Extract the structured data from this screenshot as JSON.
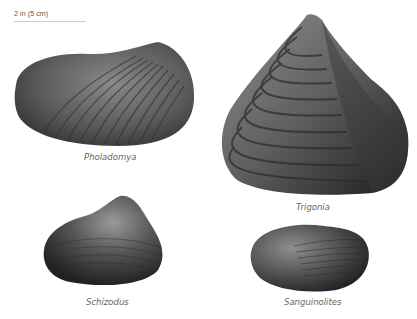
{
  "scale_bar": {
    "label": "2 in (5 cm)"
  },
  "specimens": [
    {
      "name": "Pholadomya"
    },
    {
      "name": "Trigonia"
    },
    {
      "name": "Schizodus"
    },
    {
      "name": "Sanguinolites"
    }
  ],
  "colors": {
    "background": "#ffffff",
    "shell_dark": "#2a2a2a",
    "shell_mid": "#6b6b6b",
    "shell_light": "#9a9a9a",
    "label": "#666666"
  }
}
